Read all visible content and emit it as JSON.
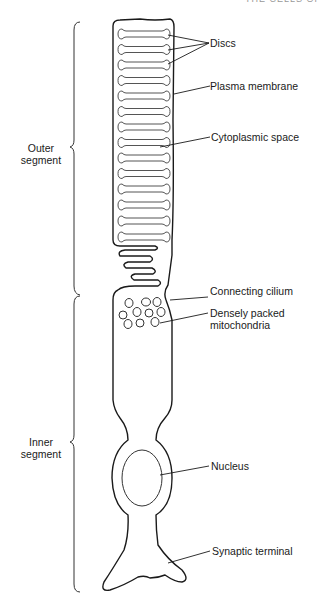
{
  "header": {
    "text": "THE CELLS OF"
  },
  "segments": {
    "outer": {
      "line1": "Outer",
      "line2": "segment"
    },
    "inner": {
      "line1": "Inner",
      "line2": "segment"
    }
  },
  "labels": {
    "discs": "Discs",
    "plasma_membrane": "Plasma membrane",
    "cytoplasmic_space": "Cytoplasmic space",
    "connecting_cilium": "Connecting cilium",
    "mitochondria_line1": "Densely packed",
    "mitochondria_line2": "mitochondria",
    "nucleus": "Nucleus",
    "synaptic_terminal": "Synaptic terminal"
  },
  "colors": {
    "stroke": "#1a1a1a",
    "disc_stroke": "#555555",
    "background": "#ffffff"
  },
  "disc_count": 14
}
